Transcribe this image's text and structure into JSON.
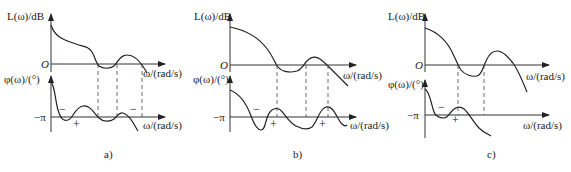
{
  "figure": {
    "panels": [
      {
        "id": "a",
        "caption": "a)",
        "magnitude_axis_label": "L(ω)/dB",
        "origin_label": "O",
        "omega_label_top": "ω/(rad/s)",
        "phase_axis_label": "φ(ω)/(°)",
        "minus_pi_label": "−π",
        "omega_label_bottom": "ω/(rad/s)",
        "crossing_signs": [
          "−",
          "+",
          "−"
        ]
      },
      {
        "id": "b",
        "caption": "b)",
        "magnitude_axis_label": "L(ω)/dB",
        "origin_label": "O",
        "omega_label_top": "ω/(rad/s)",
        "phase_axis_label": "φ(ω)/(°)",
        "minus_pi_label": "−π",
        "omega_label_bottom": "ω/(rad/s)",
        "crossing_signs": [
          "−",
          "+",
          "+"
        ]
      },
      {
        "id": "c",
        "caption": "c)",
        "magnitude_axis_label": "L(ω)/dB",
        "origin_label": "O",
        "omega_label_top": "ω/(rad/s)",
        "phase_axis_label": "φ(ω)/(°)",
        "minus_pi_label": "−π",
        "omega_label_bottom": "ω/(rad/s)",
        "crossing_signs": [
          "−",
          "+"
        ]
      }
    ],
    "colors": {
      "ink": "#222222",
      "background": "#ffffff"
    }
  }
}
